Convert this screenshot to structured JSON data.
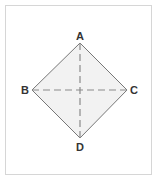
{
  "diagram": {
    "type": "square-diagonals",
    "colors": {
      "frame_border": "#d6d6d6",
      "shape_fill": "#f2f2f2",
      "shape_stroke": "#777777",
      "diagonal_stroke": "#8a8a8a",
      "label": "#333333"
    },
    "vertices": [
      {
        "id": "A",
        "label": "A",
        "x": 80,
        "y": 43
      },
      {
        "id": "B",
        "label": "B",
        "x": 32,
        "y": 90
      },
      {
        "id": "C",
        "label": "C",
        "x": 127,
        "y": 90
      },
      {
        "id": "D",
        "label": "D",
        "x": 80,
        "y": 138
      }
    ],
    "diagonals": [
      {
        "from": "A",
        "to": "D",
        "style": "dashed"
      },
      {
        "from": "B",
        "to": "C",
        "style": "dashed"
      }
    ]
  }
}
